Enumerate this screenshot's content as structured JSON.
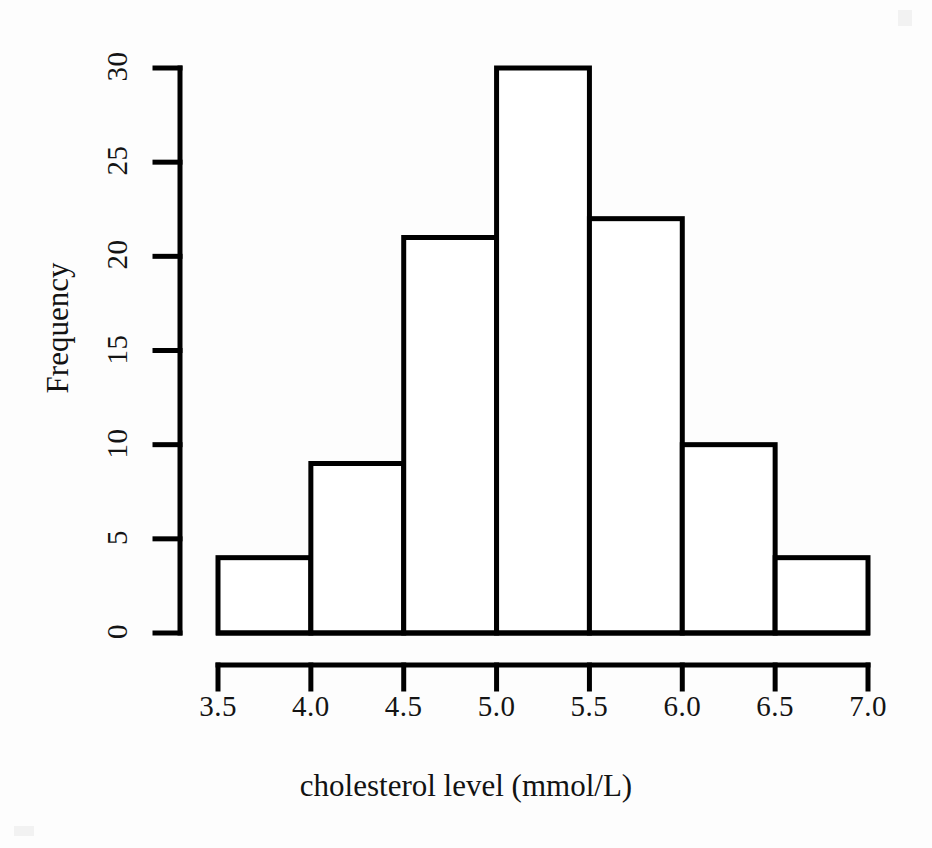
{
  "chart_data": {
    "type": "bar",
    "title": "",
    "subtitle": "",
    "xlabel": "cholesterol level (mmol/L)",
    "ylabel": "Frequency",
    "categories": [
      "3.5-4.0",
      "4.0-4.5",
      "4.5-5.0",
      "5.0-5.5",
      "5.5-6.0",
      "6.0-6.5",
      "6.5-7.0"
    ],
    "bin_edges": [
      3.5,
      4.0,
      4.5,
      5.0,
      5.5,
      6.0,
      6.5,
      7.0
    ],
    "values": [
      4,
      9,
      21,
      30,
      22,
      10,
      4
    ],
    "bin_width": 0.5,
    "xlim": [
      3.5,
      7.0
    ],
    "ylim": [
      0,
      30
    ],
    "xticks": [
      3.5,
      4.0,
      4.5,
      5.0,
      5.5,
      6.0,
      6.5,
      7.0
    ],
    "xtick_labels": [
      "3.5",
      "4.0",
      "4.5",
      "5.0",
      "5.5",
      "6.0",
      "6.5",
      "7.0"
    ],
    "yticks": [
      0,
      5,
      10,
      15,
      20,
      25,
      30
    ],
    "ytick_labels": [
      "0",
      "5",
      "10",
      "15",
      "20",
      "25",
      "30"
    ],
    "grid": false,
    "legend": false,
    "legend_position": "none",
    "bar_fill_color": "#ffffff",
    "bar_edge_color": "#000000",
    "axis_color": "#000000",
    "background_color": "#ffffff",
    "total_count": 100,
    "annotations": []
  },
  "axes": {
    "y_axis_name": "frequency-axis",
    "x_axis_name": "cholesterol-axis"
  }
}
